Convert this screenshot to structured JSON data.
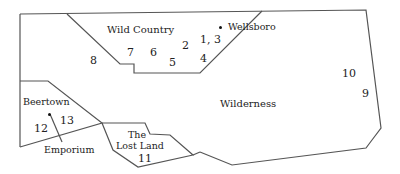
{
  "regions": {
    "wild_country": "Wild Country",
    "wilderness": "Wilderness",
    "lost_land_1": "The",
    "lost_land_2": "Lost Land"
  },
  "towns": {
    "wellsboro": "Wellsboro",
    "beertown": "Beertown",
    "emporium": "Emporium"
  },
  "sites": [
    "1, 3",
    "2",
    "4",
    "5",
    "6",
    "7",
    "8",
    "9",
    "10",
    "11",
    "12",
    "13"
  ],
  "colors": {
    "border": "#555555",
    "text": "#222222",
    "background": "#ffffff"
  }
}
